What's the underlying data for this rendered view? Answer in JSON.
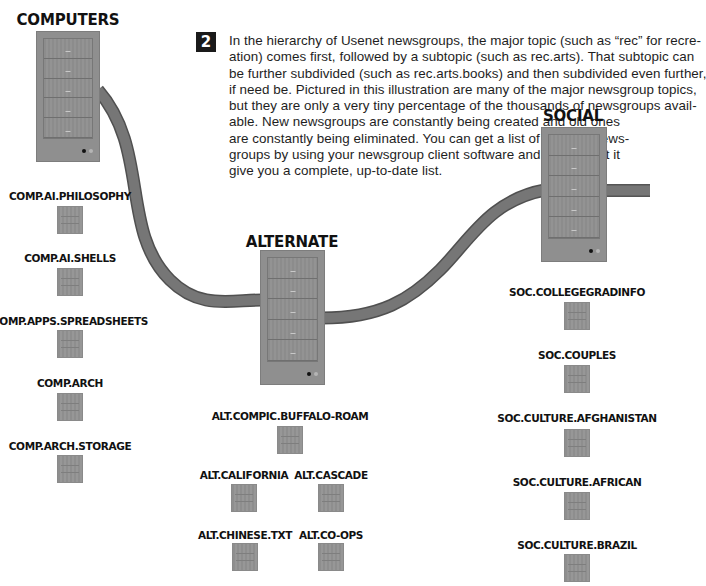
{
  "step": {
    "number": "2"
  },
  "description": {
    "lines": [
      "In the hierarchy of Usenet newsgroups, the major topic (such as “rec” for recre-",
      "ation) comes first, followed by a subtopic (such as rec.arts). That subtopic can",
      "be further subdivided (such as rec.arts.books) and then subdivided even further,",
      "if need be. Pictured in this illustration are many of the major newsgroup topics,",
      "but they are only a very tiny percentage of the thousands of newsgroups avail-",
      "able. New newsgroups are constantly being created and old ones",
      "are constantly being eliminated. You can get a list of Internet news-",
      "groups by using your newsgroup client software and asking that it",
      "give you a complete, up-to-date list."
    ]
  },
  "colors": {
    "cable": "#6e6e6e",
    "cable_edge": "#555555",
    "server": "#8f8f8f",
    "text": "#111111",
    "background": "#ffffff"
  },
  "hierarchies": [
    {
      "id": "computers",
      "title": "COMPUTERS",
      "server_icon": "server-rack-icon",
      "subgroups": [
        {
          "name": "COMP.AI.PHILOSOPHY",
          "icon": "mini-server-icon"
        },
        {
          "name": "COMP.AI.SHELLS",
          "icon": "mini-server-icon"
        },
        {
          "name": "COMP.APPS.SPREADSHEETS",
          "icon": "mini-server-icon"
        },
        {
          "name": "COMP.ARCH",
          "icon": "mini-server-icon"
        },
        {
          "name": "COMP.ARCH.STORAGE",
          "icon": "mini-server-icon"
        }
      ]
    },
    {
      "id": "alternate",
      "title": "ALTERNATE",
      "server_icon": "server-rack-icon",
      "subgroups": [
        {
          "name": "ALT.COMPIC.BUFFALO-ROAM",
          "icon": "mini-server-icon"
        },
        {
          "name": "ALT.CALIFORNIA",
          "icon": "mini-server-icon"
        },
        {
          "name": "ALT.CASCADE",
          "icon": "mini-server-icon"
        },
        {
          "name": "ALT.CHINESE.TXT",
          "icon": "mini-server-icon"
        },
        {
          "name": "ALT.CO-OPS",
          "icon": "mini-server-icon"
        }
      ]
    },
    {
      "id": "social",
      "title": "SOCIAL",
      "server_icon": "server-rack-icon",
      "subgroups": [
        {
          "name": "SOC.COLLEGEGRADINFO",
          "icon": "mini-server-icon"
        },
        {
          "name": "SOC.COUPLES",
          "icon": "mini-server-icon"
        },
        {
          "name": "SOC.CULTURE.AFGHANISTAN",
          "icon": "mini-server-icon"
        },
        {
          "name": "SOC.CULTURE.AFRICAN",
          "icon": "mini-server-icon"
        },
        {
          "name": "SOC.CULTURE.BRAZIL",
          "icon": "mini-server-icon"
        }
      ]
    }
  ]
}
